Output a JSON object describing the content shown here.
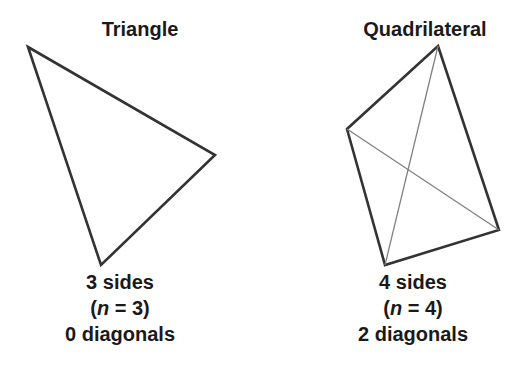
{
  "figures": [
    {
      "title": "Triangle",
      "sides_label": "3 sides",
      "n_prefix": "(",
      "n_var": "n",
      "n_suffix": " = 3)",
      "diagonals_label": "0 diagonals",
      "vertices": [
        [
          28,
          47
        ],
        [
          215,
          155
        ],
        [
          101,
          265
        ]
      ],
      "diagonals": []
    },
    {
      "title": "Quadrilateral",
      "sides_label": "4 sides",
      "n_prefix": "(",
      "n_var": "n",
      "n_suffix": " = 4)",
      "diagonals_label": "2 diagonals",
      "vertices": [
        [
          438,
          46
        ],
        [
          499,
          230
        ],
        [
          385,
          265
        ],
        [
          347,
          129
        ]
      ],
      "diagonals": [
        [
          [
            438,
            46
          ],
          [
            385,
            265
          ]
        ],
        [
          [
            347,
            129
          ],
          [
            499,
            230
          ]
        ]
      ]
    }
  ],
  "colors": {
    "edge": "#333333",
    "diagonal": "#777777",
    "text": "#1a1a1a"
  }
}
